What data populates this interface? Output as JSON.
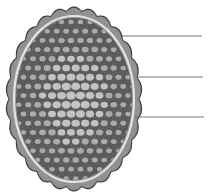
{
  "figure": {
    "colors": {
      "background": "#ffffff",
      "shell": "#7a7a7a",
      "shell_outline": "#3c3c3c",
      "membrane": "#e6e6e6",
      "interior": "#4a4a4a",
      "cells": "#b8b8b8",
      "leader_line": "#6a6a6a"
    },
    "leader_lines": [
      {
        "id": "line-1",
        "x1": 120,
        "y1": 36,
        "x2": 202,
        "y2": 36,
        "label": ""
      },
      {
        "id": "line-2",
        "x1": 137,
        "y1": 77,
        "x2": 203,
        "y2": 77,
        "label": ""
      },
      {
        "id": "line-3",
        "x1": 135,
        "y1": 117,
        "x2": 204,
        "y2": 117,
        "label": ""
      }
    ]
  }
}
